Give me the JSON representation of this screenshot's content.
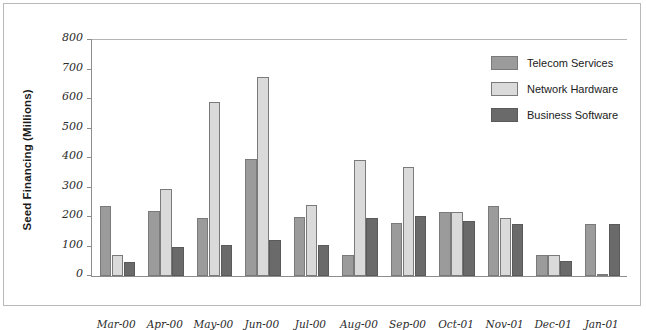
{
  "chart_data": {
    "type": "bar",
    "title": "",
    "xlabel": "",
    "ylabel": "Seed Financing (Millions)",
    "ylim": [
      0,
      800
    ],
    "ytick_step": 100,
    "yticks": [
      0,
      100,
      200,
      300,
      400,
      500,
      600,
      700,
      800
    ],
    "grid": false,
    "legend_position": "top-right",
    "categories": [
      "Mar-00",
      "Apr-00",
      "May-00",
      "Jun-00",
      "Jul-00",
      "Aug-00",
      "Sep-00",
      "Oct-01",
      "Nov-01",
      "Dec-01",
      "Jan-01"
    ],
    "series": [
      {
        "name": "Telecom Services",
        "color": "#9b9b9b",
        "values": [
          236,
          222,
          197,
          396,
          199,
          72,
          180,
          218,
          237,
          70,
          176
        ]
      },
      {
        "name": "Network Hardware",
        "color": "#dadada",
        "values": [
          70,
          296,
          591,
          674,
          240,
          394,
          368,
          218,
          195,
          70,
          6
        ]
      },
      {
        "name": "Business Software",
        "color": "#6a6a6a",
        "values": [
          48,
          99,
          105,
          122,
          104,
          196,
          204,
          185,
          177,
          51,
          176
        ]
      }
    ]
  },
  "legend": {
    "items": [
      {
        "label": "Telecom Services",
        "color": "#9b9b9b"
      },
      {
        "label": "Network Hardware",
        "color": "#dadada"
      },
      {
        "label": "Business Software",
        "color": "#6a6a6a"
      }
    ]
  }
}
